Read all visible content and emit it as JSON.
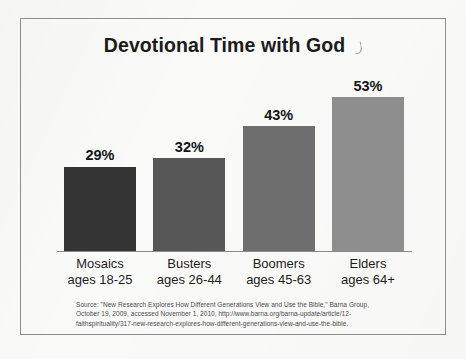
{
  "figure": {
    "title": "Devotional Time with God",
    "title_artifact_icon": "pen-stroke-artifact-icon"
  },
  "chart_data": {
    "type": "bar",
    "title": "Devotional Time with God",
    "xlabel": "",
    "ylabel": "",
    "ylim": [
      0,
      62
    ],
    "grid": false,
    "legend": "none",
    "categories": [
      "Mosaics",
      "Busters",
      "Boomers",
      "Elders"
    ],
    "category_sublabels": [
      "ages 18-25",
      "ages 26-44",
      "ages 45-63",
      "ages 64+"
    ],
    "values": [
      29,
      32,
      43,
      53
    ],
    "value_labels": [
      "29%",
      "32%",
      "43%",
      "53%"
    ],
    "bar_colors": [
      "#343434",
      "#575757",
      "#6e6e6e",
      "#8e8e8e"
    ],
    "units": "percent"
  },
  "source": {
    "line1": "Source: \"New Research Explores How Different Generations View and Use the Bible,\" Barna Group,",
    "line2": "October 19, 2009, accessed November 1, 2010, http://www.barna.org/barna-update/article/12-",
    "line3": "faithspirituality/317-new-research-explores-how-different-generations-view-and-use-the-bible."
  },
  "colors": {
    "frame": "#8d8d8d",
    "axis": "#8a8a8a",
    "page": "#fafaf9",
    "text": "#1d1d1d"
  }
}
